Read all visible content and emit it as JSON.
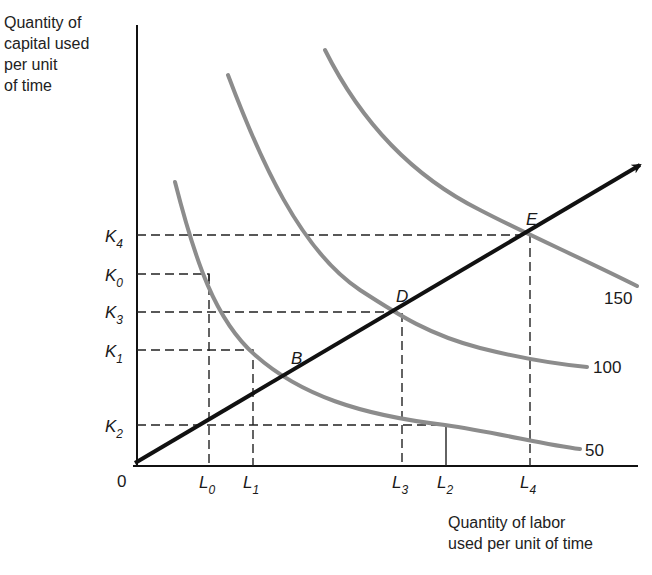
{
  "diagram": {
    "type": "isoquant expansion path",
    "y_axis_title": "Quantity of\ncapital used\nper unit\nof time",
    "x_axis_title": "Quantity of labor\nused per unit of time",
    "origin_label": "0",
    "isoquants": [
      {
        "label": "50"
      },
      {
        "label": "100"
      },
      {
        "label": "150"
      }
    ],
    "points": [
      {
        "label": "B"
      },
      {
        "label": "D"
      },
      {
        "label": "E"
      }
    ],
    "k_levels": [
      {
        "main": "K",
        "sub": "4"
      },
      {
        "main": "K",
        "sub": "0"
      },
      {
        "main": "K",
        "sub": "3"
      },
      {
        "main": "K",
        "sub": "1"
      },
      {
        "main": "K",
        "sub": "2"
      }
    ],
    "l_levels": [
      {
        "main": "L",
        "sub": "0"
      },
      {
        "main": "L",
        "sub": "1"
      },
      {
        "main": "L",
        "sub": "3"
      },
      {
        "main": "L",
        "sub": "2"
      },
      {
        "main": "L",
        "sub": "4"
      }
    ],
    "colors": {
      "isoquant": "#8c8c8c",
      "ray": "#111111",
      "axis": "#111111",
      "guides": "#222222"
    }
  }
}
